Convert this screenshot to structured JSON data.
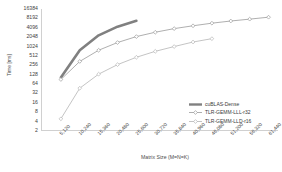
{
  "chart_data": {
    "type": "line",
    "title": "",
    "xlabel": "Matrix Size (M=N=K)",
    "ylabel": "Time [ms]",
    "yscale": "log2",
    "ylim": [
      2,
      16384
    ],
    "yticks": [
      16384,
      8192,
      4096,
      2048,
      1024,
      512,
      256,
      128,
      64,
      32,
      16,
      8,
      4,
      2
    ],
    "ytick_labels": [
      "16384",
      "8192",
      "4096",
      "2048",
      "1024",
      "512",
      "256",
      "128",
      "64",
      "32",
      "16",
      "8",
      "4",
      "2"
    ],
    "x": [
      5120,
      10240,
      15360,
      20480,
      25600,
      30720,
      35840,
      40960,
      46080,
      51200,
      56320,
      61440
    ],
    "xtick_labels": [
      "5,120",
      "10,240",
      "15,360",
      "20,480",
      "25,600",
      "30,720",
      "35,840",
      "40,960",
      "46,080",
      "51,200",
      "56,320",
      "61,440"
    ],
    "grid": false,
    "legend_position": "bottom-right",
    "series": [
      {
        "name": "cuBLAS-Dense",
        "color": "#808080",
        "marker": "none",
        "line_width": 2.6,
        "dash": "none",
        "x": [
          5120,
          10240,
          15360,
          20480,
          25600
        ],
        "values": [
          100,
          760,
          2300,
          4400,
          6800
        ]
      },
      {
        "name": "TLR-GEMM-LLL-r32",
        "color": "#9a9a9a",
        "marker": "diamond",
        "line_width": 0.8,
        "dash": "none",
        "x": [
          5120,
          10240,
          15360,
          20480,
          25600,
          30720,
          35840,
          40960,
          46080,
          51200,
          56320,
          61440
        ],
        "values": [
          86,
          330,
          760,
          1350,
          2100,
          2900,
          3800,
          4700,
          5700,
          6700,
          7700,
          8900
        ]
      },
      {
        "name": "TLR-GEMM-LLD-r16",
        "color": "#b5b5b5",
        "marker": "diamond",
        "line_width": 0.8,
        "dash": "none",
        "x": [
          5120,
          10240,
          15360,
          20480,
          25600,
          30720,
          35840,
          40960,
          46080
        ],
        "values": [
          4.6,
          45,
          128,
          260,
          450,
          700,
          1000,
          1400,
          1800
        ]
      }
    ]
  },
  "legend": {
    "items": [
      {
        "label": "cuBLAS-Dense"
      },
      {
        "label": "TLR-GEMM-LLL-r32"
      },
      {
        "label": "TLR-GEMM-LLD-r16"
      }
    ]
  }
}
